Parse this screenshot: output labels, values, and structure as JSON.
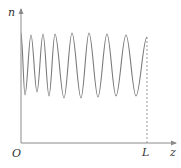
{
  "diagram": {
    "type": "oscillating-profile",
    "labels": {
      "y_axis": "n",
      "x_axis": "z",
      "origin": "O",
      "end_marker": "L"
    },
    "colors": {
      "curve": "#7a7a7a",
      "axes": "#8a8a8a",
      "dashed_line": "#9a9a9a",
      "text": "#333333"
    },
    "axes": {
      "origin_px": [
        21,
        143
      ],
      "y_axis_top_px": 9,
      "x_axis_right_px": 176
    },
    "end_line_x_px": 147,
    "waveform_points": [
      [
        21,
        33
      ],
      [
        25,
        95
      ],
      [
        31,
        35
      ],
      [
        37,
        92
      ],
      [
        43,
        34
      ],
      [
        49,
        96
      ],
      [
        55,
        34
      ],
      [
        64,
        98
      ],
      [
        72,
        33
      ],
      [
        81,
        98
      ],
      [
        89,
        33
      ],
      [
        98,
        97
      ],
      [
        107,
        34
      ],
      [
        116,
        96
      ],
      [
        126,
        35
      ],
      [
        136,
        96
      ],
      [
        147,
        37
      ]
    ]
  }
}
